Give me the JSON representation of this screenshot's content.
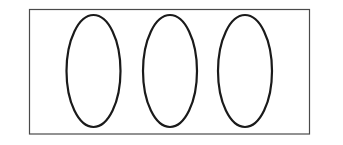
{
  "diagram": {
    "frame": {
      "x": 29.5,
      "y": 9.5,
      "width": 280,
      "height": 124.5,
      "stroke": "#4a4a4a",
      "stroke_width": 1.2
    },
    "shapes": [
      {
        "type": "ellipse",
        "cx": 93.5,
        "cy": 71,
        "rx": 27,
        "ry": 56
      },
      {
        "type": "ellipse",
        "cx": 170,
        "cy": 71,
        "rx": 27,
        "ry": 56
      },
      {
        "type": "ellipse",
        "cx": 245,
        "cy": 71,
        "rx": 27,
        "ry": 56
      }
    ],
    "ellipse_stroke": "#1a1a1a",
    "ellipse_stroke_width": 2.2,
    "background": "#ffffff"
  }
}
